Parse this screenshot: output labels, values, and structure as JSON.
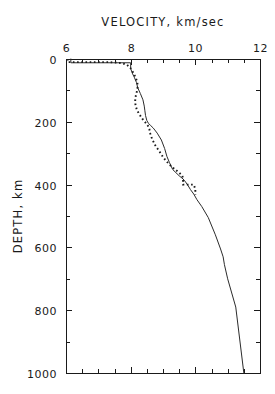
{
  "chart_data": {
    "type": "line",
    "title": "VELOCITY, km/sec",
    "xlabel": "VELOCITY, km/sec",
    "ylabel": "DEPTH, km",
    "xlim": [
      6,
      12
    ],
    "ylim": [
      0,
      1000
    ],
    "y_inverted": true,
    "grid": false,
    "legend": "none",
    "x_ticks": [
      6,
      8,
      10,
      12
    ],
    "x_tick_labels": [
      "6",
      "8",
      "10",
      "12"
    ],
    "x_minor_ticks": [
      6.5,
      7,
      7.5,
      8.5,
      9,
      9.5,
      10.5,
      11,
      11.5
    ],
    "y_ticks": [
      0,
      200,
      400,
      600,
      800,
      1000
    ],
    "y_tick_labels": [
      "0",
      "200",
      "400",
      "600",
      "800",
      "1000"
    ],
    "y_minor_ticks": [
      100,
      300,
      500,
      700,
      900
    ],
    "series": [
      {
        "name": "solid-model",
        "style": "solid",
        "color": "#2b2b2b",
        "x": [
          6.15,
          6.15,
          8.0,
          8.0,
          8.05,
          8.12,
          8.18,
          8.22,
          8.3,
          8.38,
          8.42,
          8.44,
          8.46,
          8.5,
          8.55,
          8.62,
          8.7,
          8.82,
          8.95,
          9.05,
          9.12,
          9.2,
          9.3,
          9.5,
          9.62,
          9.7,
          9.78,
          9.85,
          9.95,
          10.05,
          10.2,
          10.4,
          10.62,
          10.78,
          10.86,
          10.9,
          11.0,
          11.25,
          11.5
        ],
        "y": [
          0,
          12,
          12,
          30,
          45,
          60,
          75,
          92,
          110,
          130,
          150,
          165,
          180,
          196,
          205,
          212,
          220,
          236,
          258,
          285,
          310,
          330,
          352,
          372,
          382,
          392,
          404,
          416,
          430,
          448,
          470,
          505,
          560,
          605,
          630,
          655,
          700,
          790,
          1000
        ]
      },
      {
        "name": "dotted-model",
        "style": "dotted",
        "color": "#1a1a1a",
        "x": [
          6.05,
          6.05,
          7.35,
          7.72,
          7.88,
          7.95,
          8.02,
          8.08,
          8.15,
          8.2,
          8.22,
          8.2,
          8.16,
          8.14,
          8.15,
          8.2,
          8.28,
          8.36,
          8.44,
          8.5,
          8.55,
          8.58,
          8.6,
          8.66,
          8.76,
          8.9,
          9.0,
          9.1,
          9.2,
          9.28,
          9.38,
          9.5,
          9.6,
          9.62,
          9.62,
          9.95,
          10.0,
          10.0
        ],
        "y": [
          0,
          10,
          10,
          13,
          18,
          24,
          32,
          44,
          58,
          72,
          85,
          100,
          116,
          132,
          148,
          164,
          178,
          190,
          200,
          208,
          215,
          224,
          236,
          254,
          275,
          296,
          312,
          325,
          336,
          344,
          352,
          362,
          372,
          382,
          400,
          400,
          414,
          432
        ]
      }
    ]
  },
  "axes": {
    "x_title": "VELOCITY, km/sec",
    "y_title": "DEPTH, km"
  }
}
